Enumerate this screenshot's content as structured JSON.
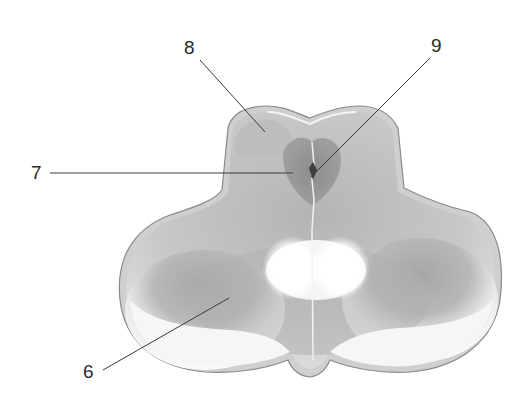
{
  "diagram": {
    "type": "anatomical cross-section",
    "labels": [
      {
        "id": "8",
        "text": "8",
        "x": 184,
        "y": 38,
        "line": [
          200,
          60,
          265,
          132
        ]
      },
      {
        "id": "9",
        "text": "9",
        "x": 431,
        "y": 36,
        "line": [
          430,
          58,
          311,
          177
        ]
      },
      {
        "id": "7",
        "text": "7",
        "x": 31,
        "y": 163,
        "line": [
          50,
          173,
          293,
          173
        ]
      },
      {
        "id": "6",
        "text": "6",
        "x": 83,
        "y": 362,
        "line": [
          103,
          370,
          229,
          298
        ]
      }
    ],
    "colors": {
      "background": "#ffffff",
      "outline": "#8a8a8a",
      "grey_matter": "#a8a8a8",
      "central_dark": "#8e8e8e",
      "white_matter": "#f4f4f4",
      "leader_line": "#3a3a3a",
      "label_text": "#2a2a2a"
    }
  }
}
